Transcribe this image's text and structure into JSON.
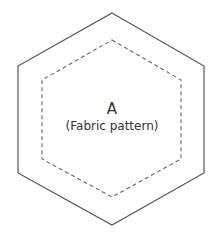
{
  "diagram": {
    "piece_letter": "A",
    "piece_description": "(Fabric pattern)",
    "colors": {
      "outline": "#555555",
      "seam_line": "#666666",
      "text": "#333333",
      "background": "#ffffff"
    },
    "shapes": [
      {
        "name": "outer-hexagon",
        "style": "solid",
        "points": "112,13 204,66 204,173 112,225 18,173 18,66"
      },
      {
        "name": "inner-hexagon",
        "style": "dashed",
        "points": "112,40 181,80 181,159 112,197 42,159 42,80"
      }
    ]
  }
}
